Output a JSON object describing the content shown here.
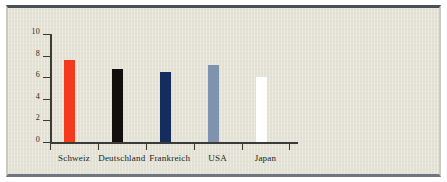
{
  "chart_data": {
    "type": "bar",
    "title": "",
    "subtitle": "",
    "xlabel": "",
    "ylabel": "",
    "categories": [
      "Schweiz",
      "Deutschland",
      "Frankreich",
      "USA",
      "Japan"
    ],
    "values": [
      7.6,
      6.8,
      6.5,
      7.1,
      6.0
    ],
    "series": [
      {
        "name": "",
        "values": [
          7.6,
          6.8,
          6.5,
          7.1,
          6.0
        ]
      }
    ],
    "bar_colors": [
      "#f4391c",
      "#120f0d",
      "#152c5e",
      "#7f93af",
      "#ffffff"
    ],
    "ylim": [
      0,
      10
    ],
    "ytick_labels": [
      "0",
      "2",
      "4",
      "6",
      "8",
      "10"
    ],
    "ytick_values": [
      0,
      2,
      4,
      6,
      8,
      10
    ],
    "grid": false,
    "legend": "none",
    "background_color": "#e3e2d4",
    "axis_color": "#3b3b38",
    "frame_top_color": "#4a5058",
    "frame_bottom_color": "#6e7681"
  }
}
